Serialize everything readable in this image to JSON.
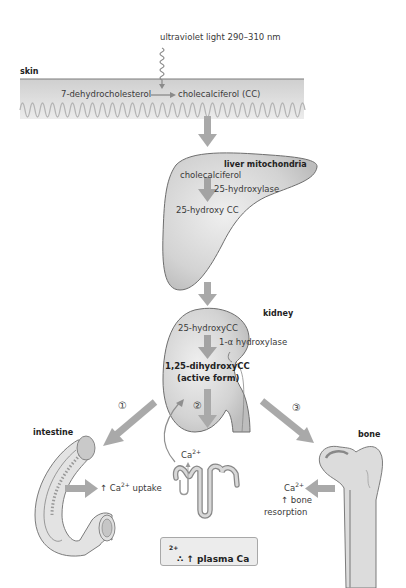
{
  "uv": {
    "label": "ultraviolet light 290–310 nm"
  },
  "skin": {
    "label": "skin",
    "substrate": "7-dehydrocholesterol",
    "product": "cholecalciferol (CC)"
  },
  "liver": {
    "label": "liver mitochondria",
    "substrate": "cholecalciferol",
    "enzyme": "25-hydroxylase",
    "product": "25-hydroxy CC"
  },
  "kidney": {
    "label": "kidney",
    "substrate": "25-hydroxyCC",
    "enzyme": "1-α hydroxylase",
    "product_line1": "1,25-dihydroxyCC",
    "product_line2": "(active form)"
  },
  "pathways": [
    {
      "marker": "①",
      "target": "intestine"
    },
    {
      "marker": "②",
      "target": "renal tubule"
    },
    {
      "marker": "③",
      "target": "bone"
    }
  ],
  "intestine": {
    "label": "intestine",
    "effect_prefix": "↑ Ca",
    "effect_sup": "2+",
    "effect_suffix": " uptake"
  },
  "tubule": {
    "ion": "Ca",
    "ion_sup": "2+"
  },
  "bone": {
    "label": "bone",
    "ion": "Ca",
    "ion_sup": "2+",
    "effect_line1": "↑ bone",
    "effect_line2": "resorption"
  },
  "result": {
    "prefix": "∴ ↑ plasma Ca",
    "sup": "2+"
  },
  "colors": {
    "arrow": "#a9a9a9",
    "organ_fill": "#d6d6d6",
    "organ_stroke": "#6e6e6e",
    "skin_band": "#dcdcdc",
    "box_fill": "#ececec"
  }
}
